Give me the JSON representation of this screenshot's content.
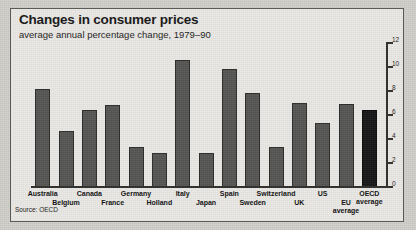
{
  "figure": {
    "title": "Changes in consumer prices",
    "subtitle": "average annual percentage change, 1979–90",
    "source": "Source: OECD"
  },
  "chart_data": {
    "type": "bar",
    "title": "Changes in consumer prices",
    "subtitle": "average annual percentage change, 1979–90",
    "xlabel": "",
    "ylabel": "",
    "ylim": [
      0,
      12
    ],
    "yticks": [
      0,
      2,
      4,
      6,
      8,
      10,
      12
    ],
    "ytick_labels": [
      "0",
      "2",
      "4",
      "6",
      "8",
      "10",
      "12"
    ],
    "axis_position": "right",
    "grid": false,
    "legend": false,
    "source": "Source: OECD",
    "categories": [
      "Australia",
      "Belgium",
      "Canada",
      "France",
      "Germany",
      "Holland",
      "Italy",
      "Japan",
      "Spain",
      "Sweden",
      "Switzerland",
      "UK",
      "US",
      "EU average",
      "OECD average"
    ],
    "values": [
      8.2,
      4.7,
      6.4,
      6.8,
      3.3,
      2.8,
      10.6,
      2.8,
      9.8,
      7.8,
      3.3,
      7.0,
      5.3,
      6.9,
      6.4
    ],
    "highlight_category": "OECD average",
    "colors": {
      "bar": "#565654",
      "bar_highlight": "#17171a",
      "background": "#e9e8e4"
    }
  },
  "labels_layout": [
    {
      "text": "Australia",
      "row": 0
    },
    {
      "text": "Belgium",
      "row": 1
    },
    {
      "text": "Canada",
      "row": 0
    },
    {
      "text": "France",
      "row": 1
    },
    {
      "text": "Germany",
      "row": 0
    },
    {
      "text": "Holland",
      "row": 1
    },
    {
      "text": "Italy",
      "row": 0
    },
    {
      "text": "Japan",
      "row": 1
    },
    {
      "text": "Spain",
      "row": 0
    },
    {
      "text": "Sweden",
      "row": 1
    },
    {
      "text": "Switzerland",
      "row": 0
    },
    {
      "text": "UK",
      "row": 1
    },
    {
      "text": "US",
      "row": 0
    },
    {
      "text": "EU\naverage",
      "row": 1
    },
    {
      "text": "OECD\naverage",
      "row": 0
    }
  ]
}
